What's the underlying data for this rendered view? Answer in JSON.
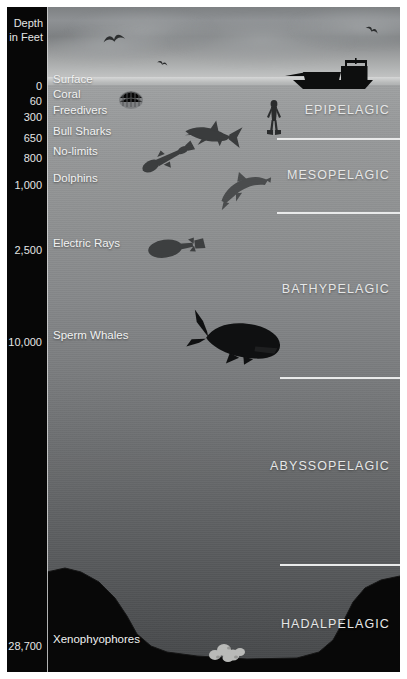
{
  "scale": {
    "header_line1": "Depth",
    "header_line2": "in Feet",
    "ticks": [
      {
        "depth": "0",
        "label": "Surface",
        "y": 80,
        "icon": "surface-line-icon"
      },
      {
        "depth": "60",
        "label": "Coral",
        "y": 95,
        "icon": "coral-icon"
      },
      {
        "depth": "300",
        "label": "Freedivers",
        "y": 111,
        "icon": "freediver-icon"
      },
      {
        "depth": "650",
        "label": "Bull Sharks",
        "y": 132,
        "icon": "shark-icon"
      },
      {
        "depth": "800",
        "label": "No-limits",
        "y": 152,
        "icon": "nolimits-diver-icon"
      },
      {
        "depth": "1,000",
        "label": "Dolphins",
        "y": 179,
        "icon": "dolphin-icon"
      },
      {
        "depth": "2,500",
        "label": "Electric Rays",
        "y": 244,
        "icon": "electric-ray-icon"
      },
      {
        "depth": "10,000",
        "label": "Sperm Whales",
        "y": 336,
        "icon": "sperm-whale-icon"
      },
      {
        "depth": "28,700",
        "label": "Xenophyophores",
        "y": 640,
        "icon": "xenophyophore-icon"
      }
    ]
  },
  "zones": [
    {
      "name": "EPIPELAGIC",
      "label_y": 111,
      "line_y": 138
    },
    {
      "name": "MESOPELAGIC",
      "label_y": 176,
      "line_y": 212
    },
    {
      "name": "BATHYPELAGIC",
      "label_y": 290,
      "line_y": 377
    },
    {
      "name": "ABYSSOPELAGIC",
      "label_y": 467,
      "line_y": 564
    },
    {
      "name": "HADALPELAGIC",
      "label_y": 625,
      "line_y": -1
    }
  ],
  "sky": {
    "birds": [
      {
        "name": "bird-icon",
        "x": 56,
        "y": 27,
        "w": 22,
        "r": -10
      },
      {
        "name": "bird-icon",
        "x": 110,
        "y": 54,
        "w": 11,
        "r": 18
      },
      {
        "name": "bird-icon",
        "x": 318,
        "y": 20,
        "w": 14,
        "r": 25
      },
      {
        "name": "bird-icon",
        "x": 368,
        "y": 28,
        "w": 13,
        "r": -20
      }
    ]
  },
  "creatures": [
    {
      "name": "boat-icon",
      "x": 285,
      "y": 58,
      "w": 88,
      "h": 30
    },
    {
      "name": "coral-icon",
      "x": 118,
      "y": 88,
      "w": 24,
      "h": 20
    },
    {
      "name": "freediver-icon",
      "x": 264,
      "y": 100,
      "w": 18,
      "h": 30
    },
    {
      "name": "shark-icon",
      "x": 182,
      "y": 119,
      "w": 56,
      "h": 30
    },
    {
      "name": "nolimits-diver-icon",
      "x": 140,
      "y": 143,
      "w": 54,
      "h": 30
    },
    {
      "name": "dolphin-icon",
      "x": 218,
      "y": 172,
      "w": 48,
      "h": 28
    },
    {
      "name": "electric-ray-icon",
      "x": 148,
      "y": 232,
      "w": 56,
      "h": 26
    },
    {
      "name": "sperm-whale-icon",
      "x": 186,
      "y": 314,
      "w": 94,
      "h": 50
    },
    {
      "name": "xenophyophore-icon",
      "x": 208,
      "y": 640,
      "w": 36,
      "h": 20
    }
  ],
  "colors": {
    "scale_background": "#070707",
    "scale_text": "#e4e5e5",
    "zone_text": "#e6e7e7",
    "zone_line": "#e9eaea",
    "creature_label": "#f1f2f2",
    "surface_water": "#9fa1a2",
    "deep_water": "#454749",
    "seafloor": "#090909"
  }
}
